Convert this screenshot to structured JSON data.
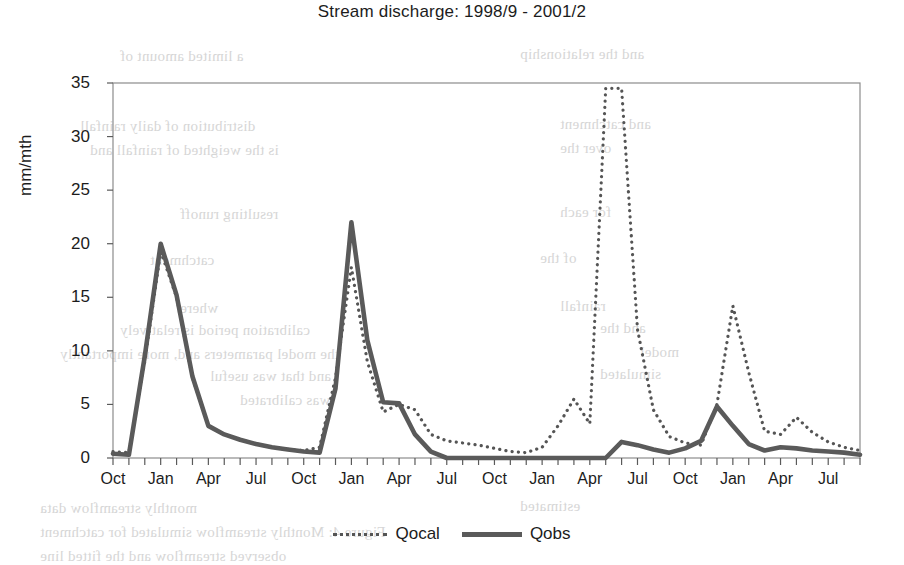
{
  "chart_data": {
    "type": "line",
    "title": "Stream discharge: 1998/9 - 2001/2",
    "xlabel": "",
    "ylabel": "mm/mth",
    "ylim": [
      0,
      35
    ],
    "yticks": [
      0,
      5,
      10,
      15,
      20,
      25,
      30,
      35
    ],
    "grid": false,
    "legend_position": "bottom-center",
    "x_tick_labels": [
      "Oct",
      "Jan",
      "Apr",
      "Jul",
      "Oct",
      "Jan",
      "Apr",
      "Jul",
      "Oct",
      "Jan",
      "Apr",
      "Jul",
      "Oct",
      "Jan",
      "Apr",
      "Jul"
    ],
    "x": [
      "Oct-98",
      "Nov-98",
      "Dec-98",
      "Jan-99",
      "Feb-99",
      "Mar-99",
      "Apr-99",
      "May-99",
      "Jun-99",
      "Jul-99",
      "Aug-99",
      "Sep-99",
      "Oct-99",
      "Nov-99",
      "Dec-99",
      "Jan-00",
      "Feb-00",
      "Mar-00",
      "Apr-00",
      "May-00",
      "Jun-00",
      "Jul-00",
      "Aug-00",
      "Sep-00",
      "Oct-00",
      "Nov-00",
      "Dec-00",
      "Jan-01",
      "Feb-01",
      "Mar-01",
      "Apr-01",
      "May-01",
      "Jun-01",
      "Jul-01",
      "Aug-01",
      "Sep-01",
      "Oct-01",
      "Nov-01",
      "Dec-01",
      "Jan-02",
      "Feb-02",
      "Mar-02",
      "Apr-02",
      "May-02",
      "Jun-02",
      "Jul-02",
      "Aug-02",
      "Sep-02"
    ],
    "series": [
      {
        "name": "Qocal",
        "style": "dotted",
        "color": "#555555",
        "values": [
          0.6,
          0.5,
          9.0,
          19.3,
          15.0,
          7.5,
          3.0,
          2.2,
          1.7,
          1.3,
          1.0,
          0.8,
          0.7,
          1.0,
          7.5,
          17.8,
          9.0,
          4.3,
          5.0,
          4.5,
          2.2,
          1.6,
          1.4,
          1.2,
          0.9,
          0.6,
          0.5,
          1.0,
          3.0,
          5.5,
          3.2,
          34.5,
          34.5,
          12.0,
          4.5,
          2.0,
          1.4,
          1.2,
          5.0,
          14.2,
          8.0,
          2.5,
          2.2,
          3.8,
          2.4,
          1.5,
          1.0,
          0.7
        ]
      },
      {
        "name": "Qobs",
        "style": "solid",
        "color": "#5a5a5a",
        "values": [
          0.4,
          0.3,
          9.5,
          20.0,
          15.2,
          7.6,
          3.0,
          2.2,
          1.7,
          1.3,
          1.0,
          0.8,
          0.6,
          0.5,
          6.5,
          22.0,
          11.0,
          5.2,
          5.1,
          2.2,
          0.6,
          0.0,
          0.0,
          0.0,
          0.0,
          0.0,
          0.0,
          0.0,
          0.0,
          0.0,
          0.0,
          0.0,
          1.5,
          1.2,
          0.8,
          0.5,
          0.9,
          1.6,
          4.8,
          3.0,
          1.3,
          0.7,
          1.0,
          0.9,
          0.7,
          0.6,
          0.5,
          0.3
        ]
      }
    ]
  },
  "legend": {
    "entries": [
      {
        "label": "Qocal"
      },
      {
        "label": "Qobs"
      }
    ]
  },
  "ghost_text": [
    {
      "x": 120,
      "y": 48,
      "text": "a limited amount of"
    },
    {
      "x": 520,
      "y": 46,
      "text": "and the relationship"
    },
    {
      "x": 80,
      "y": 118,
      "text": "distribution of daily rainfall"
    },
    {
      "x": 560,
      "y": 116,
      "text": "and catchment"
    },
    {
      "x": 90,
      "y": 142,
      "text": "is the weighted of rainfall and"
    },
    {
      "x": 560,
      "y": 140,
      "text": "over the"
    },
    {
      "x": 180,
      "y": 206,
      "text": "resulting runoff"
    },
    {
      "x": 560,
      "y": 204,
      "text": "for each"
    },
    {
      "x": 150,
      "y": 252,
      "text": "catchment"
    },
    {
      "x": 540,
      "y": 250,
      "text": "of the"
    },
    {
      "x": 180,
      "y": 300,
      "text": "where"
    },
    {
      "x": 560,
      "y": 298,
      "text": "rainfall"
    },
    {
      "x": 120,
      "y": 322,
      "text": "calibration period is relatively"
    },
    {
      "x": 600,
      "y": 320,
      "text": "and the"
    },
    {
      "x": 60,
      "y": 346,
      "text": "the model parameters and, more importantly"
    },
    {
      "x": 640,
      "y": 344,
      "text": "model"
    },
    {
      "x": 210,
      "y": 368,
      "text": "and that was useful"
    },
    {
      "x": 600,
      "y": 366,
      "text": "simulated"
    },
    {
      "x": 240,
      "y": 392,
      "text": "was calibrated"
    },
    {
      "x": 40,
      "y": 500,
      "text": "monthly streamflow data"
    },
    {
      "x": 520,
      "y": 498,
      "text": "estimated"
    },
    {
      "x": 40,
      "y": 524,
      "text": "Figure 4: Monthly streamflow simulated for catchment"
    },
    {
      "x": 40,
      "y": 548,
      "text": "observed streamflow and the fitted line"
    }
  ]
}
